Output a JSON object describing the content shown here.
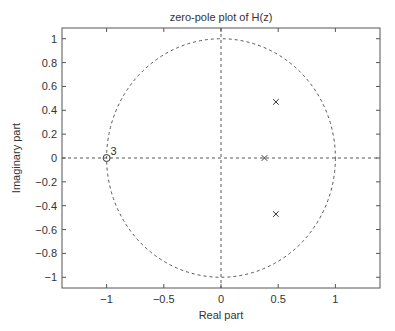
{
  "chart_data": {
    "type": "scatter",
    "title": "zero-pole plot of H(z)",
    "xlabel": "Real part",
    "ylabel": "Imaginary part",
    "xlim": [
      -1.39,
      1.39
    ],
    "ylim": [
      -1.09,
      1.09
    ],
    "xticks": [
      -1,
      -0.5,
      0,
      0.5,
      1
    ],
    "xtick_labels": [
      "−1",
      "−0.5",
      "0",
      "0.5",
      "1"
    ],
    "yticks": [
      1,
      0.8,
      0.6,
      0.4,
      0.2,
      0,
      -0.2,
      -0.4,
      -0.6,
      -0.8,
      -1
    ],
    "ytick_labels": [
      "1",
      "0.8",
      "0.6",
      "0.4",
      "0.2",
      "0",
      "−0.2",
      "−0.4",
      "−0.6",
      "−0.8",
      "−1"
    ],
    "grid": false,
    "unit_circle": {
      "radius": 1,
      "style": "dashed"
    },
    "reference_axes": {
      "style": "dashed",
      "x0": true,
      "y0": true
    },
    "series": [
      {
        "name": "zeros",
        "marker": "o",
        "points": [
          {
            "x": -1,
            "y": 0,
            "multiplicity": 3
          }
        ]
      },
      {
        "name": "poles",
        "marker": "x",
        "points": [
          {
            "x": 0.48,
            "y": 0.47
          },
          {
            "x": 0.38,
            "y": 0
          },
          {
            "x": 0.48,
            "y": -0.47
          }
        ]
      }
    ],
    "annotations": [
      {
        "text": "3",
        "x": -1,
        "y": 0,
        "position": "upper-right"
      }
    ],
    "colors": {
      "axes": "#555555",
      "dashed": "#444444",
      "marker": "#333333",
      "text": "#333333"
    }
  }
}
